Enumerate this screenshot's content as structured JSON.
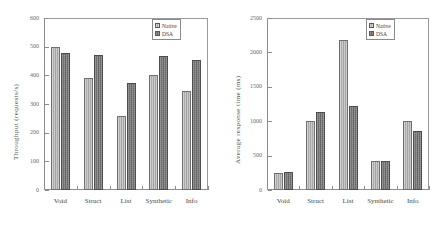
{
  "figure": {
    "background": "#ffffff",
    "series_colors": {
      "native": "#ababab",
      "dsa": "#6e6e6e"
    }
  },
  "charts": [
    {
      "id": "throughput",
      "type": "bar",
      "title": "",
      "xlabel": "",
      "ylabel": "Throughput (requests/s)",
      "categories": [
        "Void",
        "Struct",
        "List",
        "Synthetic",
        "Info"
      ],
      "yticks": [
        0,
        100,
        200,
        300,
        400,
        500,
        600
      ],
      "ylim": [
        0,
        600
      ],
      "grid": false,
      "legend_position": "top-right",
      "series": [
        {
          "name": "Native",
          "values": [
            500,
            392,
            259,
            402,
            345
          ]
        },
        {
          "name": "DSA",
          "values": [
            479,
            470,
            374,
            468,
            453
          ]
        }
      ]
    },
    {
      "id": "response-time",
      "type": "bar",
      "title": "",
      "xlabel": "",
      "ylabel": "Average response time (ms)",
      "categories": [
        "Void",
        "Struct",
        "List",
        "Synthetic",
        "Info"
      ],
      "yticks": [
        0,
        500,
        1000,
        1500,
        2000,
        2500
      ],
      "ylim": [
        0,
        2500
      ],
      "grid": false,
      "legend_position": "top-right",
      "series": [
        {
          "name": "Native",
          "values": [
            243,
            1000,
            2180,
            420,
            1005
          ]
        },
        {
          "name": "DSA",
          "values": [
            258,
            1135,
            1215,
            428,
            860
          ]
        }
      ]
    }
  ],
  "chart_data": [
    {
      "type": "bar",
      "title": "Throughput (requests/s)",
      "xlabel": "",
      "ylabel": "Throughput (requests/s)",
      "categories": [
        "Void",
        "Struct",
        "List",
        "Synthetic",
        "Info"
      ],
      "series": [
        {
          "name": "Native",
          "values": [
            500,
            392,
            259,
            402,
            345
          ]
        },
        {
          "name": "DSA",
          "values": [
            479,
            470,
            374,
            468,
            453
          ]
        }
      ],
      "ylim": [
        0,
        600
      ],
      "yticks": [
        0,
        100,
        200,
        300,
        400,
        500,
        600
      ],
      "grid": false,
      "legend": [
        "Native",
        "DSA"
      ],
      "legend_position": "top-right"
    },
    {
      "type": "bar",
      "title": "Average response time (ms)",
      "xlabel": "",
      "ylabel": "Average response time (ms)",
      "categories": [
        "Void",
        "Struct",
        "List",
        "Synthetic",
        "Info"
      ],
      "series": [
        {
          "name": "Native",
          "values": [
            243,
            1000,
            2180,
            420,
            1005
          ]
        },
        {
          "name": "DSA",
          "values": [
            258,
            1135,
            1215,
            428,
            860
          ]
        }
      ],
      "ylim": [
        0,
        2500
      ],
      "yticks": [
        0,
        500,
        1000,
        1500,
        2000,
        2500
      ],
      "grid": false,
      "legend": [
        "Native",
        "DSA"
      ],
      "legend_position": "top-right"
    }
  ]
}
